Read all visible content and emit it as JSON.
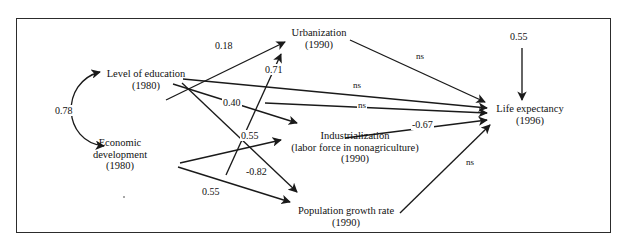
{
  "figure": {
    "type": "path-diagram",
    "border_color": "#2c2c2c",
    "line_color": "#1a1a1a",
    "background": "#ffffff"
  },
  "nodes": [
    {
      "id": "education",
      "line1": "Level of education",
      "line2": "(1980)",
      "line3": ""
    },
    {
      "id": "economic",
      "line1": "Economic",
      "line2": "development",
      "line3": "(1980)"
    },
    {
      "id": "urbanization",
      "line1": "Urbanization",
      "line2": "(1990)",
      "line3": ""
    },
    {
      "id": "industrialization",
      "line1": "Industrialization",
      "line2": "(labor force in nonagriculture)",
      "line3": "(1990)"
    },
    {
      "id": "population",
      "line1": "Population growth rate",
      "line2": "(1990)",
      "line3": ""
    },
    {
      "id": "life",
      "line1": "Life expectancy",
      "line2": "(1996)",
      "line3": ""
    }
  ],
  "paths": [
    {
      "id": "cov-edu-econ",
      "from": "economic",
      "to": "education",
      "label": "0.78",
      "kind": "covariance"
    },
    {
      "id": "econ-urban",
      "from": "economic",
      "to": "urbanization",
      "label": "0.18",
      "kind": "directed"
    },
    {
      "id": "edu-urban",
      "from": "education",
      "to": "urbanization",
      "label": "0.71",
      "kind": "directed"
    },
    {
      "id": "edu-indus",
      "from": "education",
      "to": "industrialization",
      "label": "0.40",
      "kind": "directed"
    },
    {
      "id": "econ-indus",
      "from": "economic",
      "to": "industrialization",
      "label": "0.55",
      "kind": "directed"
    },
    {
      "id": "edu-pop",
      "from": "education",
      "to": "population",
      "label": "-0.82",
      "kind": "directed"
    },
    {
      "id": "econ-pop",
      "from": "economic",
      "to": "population",
      "label": "0.55",
      "kind": "directed"
    },
    {
      "id": "urban-life",
      "from": "urbanization",
      "to": "life",
      "label": "ns",
      "kind": "directed"
    },
    {
      "id": "edu-life",
      "from": "education",
      "to": "life",
      "label": "ns",
      "kind": "directed"
    },
    {
      "id": "econ-life",
      "from": "economic",
      "to": "life",
      "label": "ns",
      "kind": "directed"
    },
    {
      "id": "indus-life",
      "from": "industrialization",
      "to": "life",
      "label": "-0.67",
      "kind": "directed"
    },
    {
      "id": "pop-life",
      "from": "population",
      "to": "life",
      "label": "ns",
      "kind": "directed"
    },
    {
      "id": "disturbance-life",
      "from": "disturbance",
      "to": "life",
      "label": "0.55",
      "kind": "disturbance"
    }
  ]
}
